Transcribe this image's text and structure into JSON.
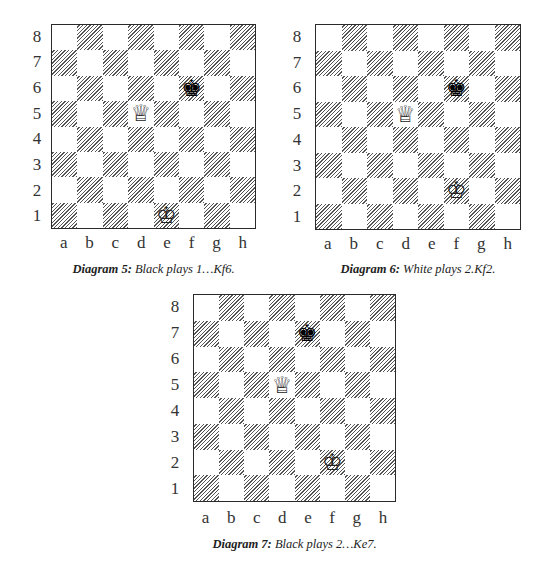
{
  "diagrams": [
    {
      "id": "diagram-5",
      "caption_label": "Diagram 5:",
      "caption_text": " Black plays 1…Kf6.",
      "ranks": [
        "8",
        "7",
        "6",
        "5",
        "4",
        "3",
        "2",
        "1"
      ],
      "files": [
        "a",
        "b",
        "c",
        "d",
        "e",
        "f",
        "g",
        "h"
      ],
      "pieces": [
        {
          "square": "f6",
          "piece": "king",
          "color": "black",
          "glyph": "♚"
        },
        {
          "square": "d5",
          "piece": "queen",
          "color": "white",
          "glyph": "♕"
        },
        {
          "square": "e1",
          "piece": "king",
          "color": "white",
          "glyph": "♔"
        }
      ]
    },
    {
      "id": "diagram-6",
      "caption_label": "Diagram 6:",
      "caption_text": " White plays 2.Kf2.",
      "ranks": [
        "8",
        "7",
        "6",
        "5",
        "4",
        "3",
        "2",
        "1"
      ],
      "files": [
        "a",
        "b",
        "c",
        "d",
        "e",
        "f",
        "g",
        "h"
      ],
      "pieces": [
        {
          "square": "f6",
          "piece": "king",
          "color": "black",
          "glyph": "♚"
        },
        {
          "square": "d5",
          "piece": "queen",
          "color": "white",
          "glyph": "♕"
        },
        {
          "square": "f2",
          "piece": "king",
          "color": "white",
          "glyph": "♔"
        }
      ]
    },
    {
      "id": "diagram-7",
      "caption_label": "Diagram 7:",
      "caption_text": " Black plays 2…Ke7.",
      "ranks": [
        "8",
        "7",
        "6",
        "5",
        "4",
        "3",
        "2",
        "1"
      ],
      "files": [
        "a",
        "b",
        "c",
        "d",
        "e",
        "f",
        "g",
        "h"
      ],
      "pieces": [
        {
          "square": "e7",
          "piece": "king",
          "color": "black",
          "glyph": "♚"
        },
        {
          "square": "d5",
          "piece": "queen",
          "color": "white",
          "glyph": "♕"
        },
        {
          "square": "f2",
          "piece": "king",
          "color": "white",
          "glyph": "♔"
        }
      ]
    }
  ]
}
